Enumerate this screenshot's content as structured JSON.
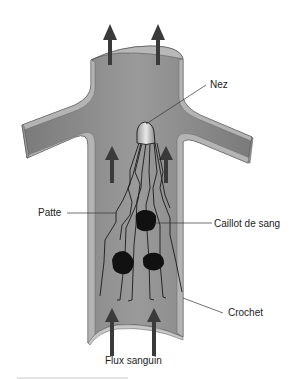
{
  "diagram": {
    "labels": {
      "nose": "Nez",
      "leg": "Patte",
      "clot": "Caillot de sang",
      "hook": "Crochet",
      "flow": "Flux sanguin"
    },
    "colors": {
      "vessel_fill": "#8a8a8a",
      "vessel_wall": "#b4b4b4",
      "vessel_outline": "#555555",
      "arrow": "#3a3a3a",
      "clot": "#111111",
      "filter_wire": "#1a1a1a",
      "leader_line": "#333333"
    },
    "arrows": [
      {
        "position": "top-left",
        "direction": "up"
      },
      {
        "position": "top-right",
        "direction": "up"
      },
      {
        "position": "middle-left",
        "direction": "up"
      },
      {
        "position": "middle-right",
        "direction": "up"
      },
      {
        "position": "bottom-left",
        "direction": "up"
      },
      {
        "position": "bottom-right",
        "direction": "up"
      }
    ],
    "clots": 3
  }
}
